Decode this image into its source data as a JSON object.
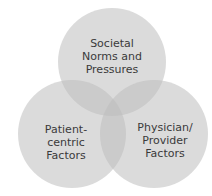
{
  "diagram": {
    "type": "venn",
    "fill_color": "#c8c8c8",
    "circles": [
      {
        "id": "societal",
        "label": [
          "Societal",
          "Norms and",
          "Pressures"
        ]
      },
      {
        "id": "patient",
        "label": [
          "Patient-",
          "centric",
          "Factors"
        ]
      },
      {
        "id": "physician",
        "label": [
          "Physician/",
          "Provider",
          "Factors"
        ]
      }
    ]
  }
}
